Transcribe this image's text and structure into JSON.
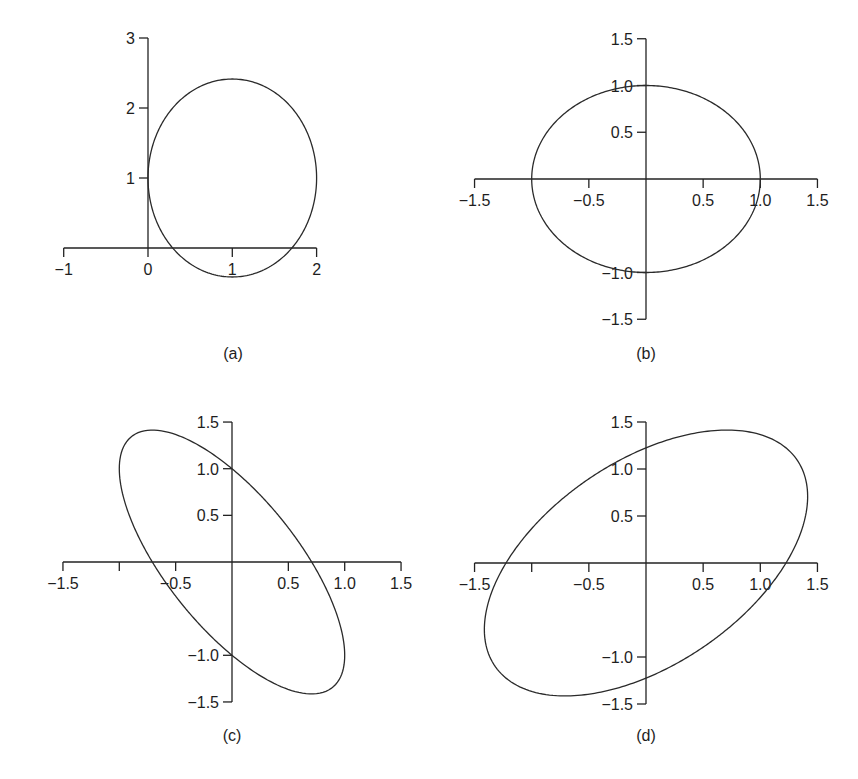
{
  "figure": {
    "panels": [
      {
        "id": "a",
        "caption": "(a)",
        "origin_px": [
          148,
          248
        ],
        "scale_px": [
          84.3,
          70
        ],
        "x_axis": {
          "range": [
            -1,
            2
          ],
          "ticks": [
            -1,
            0,
            1,
            2
          ],
          "tick_labels": [
            "−1",
            "0",
            "1",
            "2"
          ]
        },
        "y_axis": {
          "range": [
            0,
            3
          ],
          "ticks": [
            1,
            2,
            3
          ],
          "tick_labels": [
            "1",
            "2",
            "3"
          ]
        },
        "caption_px": [
          233,
          359
        ]
      },
      {
        "id": "b",
        "caption": "(b)",
        "origin_px": [
          646,
          179
        ],
        "scale_px": [
          114.3,
          93.5
        ],
        "x_axis": {
          "range": [
            -1.5,
            1.5
          ],
          "ticks": [
            -1.5,
            -0.5,
            0.5,
            1.0,
            1.5
          ],
          "tick_labels": [
            "−1.5",
            "−0.5",
            "0.5",
            "1.0",
            "1.5"
          ]
        },
        "y_axis": {
          "range": [
            -1.5,
            1.5
          ],
          "ticks": [
            -1.5,
            -1.0,
            0.5,
            1.0,
            1.5
          ],
          "tick_labels": [
            "−1.5",
            "−1.0",
            "0.5",
            "1.0",
            "1.5"
          ]
        },
        "caption_px": [
          646,
          359
        ]
      },
      {
        "id": "c",
        "caption": "(c)",
        "origin_px": [
          232,
          562
        ],
        "scale_px": [
          112.7,
          93.3
        ],
        "x_axis": {
          "range": [
            -1.5,
            1.5
          ],
          "ticks": [
            -1.5,
            -1.0,
            -0.5,
            0.5,
            1.0,
            1.5
          ],
          "tick_labels": [
            "−1.5",
            "",
            "−0.5",
            "0.5",
            "1.0",
            "1.5"
          ]
        },
        "y_axis": {
          "range": [
            -1.5,
            1.5
          ],
          "ticks": [
            -1.5,
            -1.0,
            0.5,
            1.0,
            1.5
          ],
          "tick_labels": [
            "−1.5",
            "−1.0",
            "0.5",
            "1.0",
            "1.5"
          ]
        },
        "caption_px": [
          232,
          741
        ]
      },
      {
        "id": "d",
        "caption": "(d)",
        "origin_px": [
          646,
          563
        ],
        "scale_px": [
          114.3,
          94
        ],
        "x_axis": {
          "range": [
            -1.5,
            1.5
          ],
          "ticks": [
            -1.5,
            -1.0,
            -0.5,
            0.5,
            1.0,
            1.5
          ],
          "tick_labels": [
            "−1.5",
            "",
            "−0.5",
            "0.5",
            "1.0",
            "1.5"
          ]
        },
        "y_axis": {
          "range": [
            -1.5,
            1.5
          ],
          "ticks": [
            -1.5,
            -1.0,
            0.5,
            1.0,
            1.5
          ],
          "tick_labels": [
            "−1.5",
            "−1.0",
            "0.5",
            "1.0",
            "1.5"
          ]
        },
        "caption_px": [
          646,
          741
        ]
      }
    ]
  },
  "chart_data": [
    {
      "type": "line",
      "title": "(a)",
      "description": "Ellipse centered at (1, 1): (x-1)^2 + (y-1)^2/2 = 1",
      "curve": {
        "kind": "ellipse",
        "center": [
          1,
          1
        ],
        "quadratic_form": {
          "a": 1,
          "b": 0,
          "c": 0.5,
          "rhs": 1
        }
      },
      "key_points": {
        "left": [
          0,
          1
        ],
        "right": [
          2,
          1
        ],
        "top": [
          1,
          2.41
        ],
        "bottom": [
          1,
          -0.41
        ]
      },
      "xlim": [
        -1,
        2
      ],
      "ylim": [
        0,
        3
      ],
      "xticks": [
        -1,
        0,
        1,
        2
      ],
      "yticks": [
        1,
        2,
        3
      ],
      "xlabel": "",
      "ylabel": "",
      "grid": false,
      "legend": null
    },
    {
      "type": "line",
      "title": "(b)",
      "description": "Unit circle x^2 + y^2 = 1",
      "curve": {
        "kind": "ellipse",
        "center": [
          0,
          0
        ],
        "quadratic_form": {
          "a": 1,
          "b": 0,
          "c": 1,
          "rhs": 1
        }
      },
      "key_points": {
        "left": [
          -1,
          0
        ],
        "right": [
          1,
          0
        ],
        "top": [
          0,
          1
        ],
        "bottom": [
          0,
          -1
        ]
      },
      "xlim": [
        -1.5,
        1.5
      ],
      "ylim": [
        -1.5,
        1.5
      ],
      "xticks": [
        -1.5,
        -0.5,
        0.5,
        1.0,
        1.5
      ],
      "yticks": [
        -1.5,
        -1.0,
        0.5,
        1.0,
        1.5
      ],
      "xlabel": "",
      "ylabel": "",
      "grid": false,
      "legend": null
    },
    {
      "type": "line",
      "title": "(c)",
      "description": "Rotated ellipse 2x^2 + 2xy + y^2 = 1 (tilted toward negative slope)",
      "curve": {
        "kind": "ellipse",
        "center": [
          0,
          0
        ],
        "quadratic_form": {
          "a": 2,
          "b": 2,
          "c": 1,
          "rhs": 1
        }
      },
      "key_points": {
        "y_intercepts": [
          1,
          -1
        ],
        "x_intercepts": [
          -0.71,
          0.71
        ],
        "top": [
          -0.71,
          1.41
        ],
        "bottom": [
          0.71,
          -1.41
        ],
        "left": [
          -1,
          1
        ],
        "right": [
          1,
          -1
        ]
      },
      "xlim": [
        -1.5,
        1.5
      ],
      "ylim": [
        -1.5,
        1.5
      ],
      "xticks": [
        -1.5,
        -1.0,
        -0.5,
        0.5,
        1.0,
        1.5
      ],
      "yticks": [
        -1.5,
        -1.0,
        0.5,
        1.0,
        1.5
      ],
      "xlabel": "",
      "ylabel": "",
      "grid": false,
      "legend": null
    },
    {
      "type": "line",
      "title": "(d)",
      "description": "Rotated ellipse x^2 - xy + y^2 = 1.5 (tilted toward positive slope)",
      "curve": {
        "kind": "ellipse",
        "center": [
          0,
          0
        ],
        "quadratic_form": {
          "a": 1,
          "b": -1,
          "c": 1,
          "rhs": 1.5
        }
      },
      "key_points": {
        "y_intercepts": [
          1.22,
          -1.22
        ],
        "x_intercepts": [
          -1.22,
          1.22
        ],
        "top": [
          0.71,
          1.41
        ],
        "bottom": [
          -0.71,
          -1.41
        ],
        "left": [
          -1.41,
          -0.71
        ],
        "right": [
          1.41,
          0.71
        ]
      },
      "xlim": [
        -1.5,
        1.5
      ],
      "ylim": [
        -1.5,
        1.5
      ],
      "xticks": [
        -1.5,
        -1.0,
        -0.5,
        0.5,
        1.0,
        1.5
      ],
      "yticks": [
        -1.5,
        -1.0,
        0.5,
        1.0,
        1.5
      ],
      "xlabel": "",
      "ylabel": "",
      "grid": false,
      "legend": null
    }
  ]
}
